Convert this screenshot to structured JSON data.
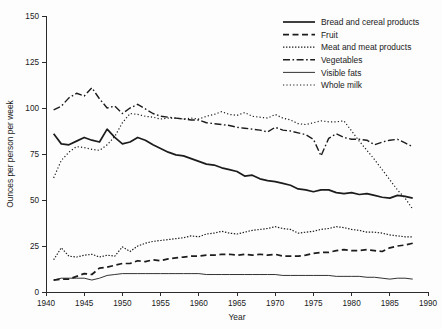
{
  "chart_data": {
    "type": "line",
    "title": "",
    "xlabel": "Year",
    "ylabel": "Ounces per person per week",
    "xlim": [
      1940,
      1990
    ],
    "ylim": [
      0,
      150
    ],
    "xticks": [
      1940,
      1945,
      1950,
      1955,
      1960,
      1965,
      1970,
      1975,
      1980,
      1985,
      1990
    ],
    "yticks": [
      0,
      25,
      50,
      75,
      100,
      125,
      150
    ],
    "grid": false,
    "legend_position": "top-right",
    "x": [
      1941,
      1942,
      1943,
      1944,
      1945,
      1946,
      1947,
      1948,
      1949,
      1950,
      1951,
      1952,
      1953,
      1954,
      1955,
      1956,
      1957,
      1958,
      1959,
      1960,
      1961,
      1962,
      1963,
      1964,
      1965,
      1966,
      1967,
      1968,
      1969,
      1970,
      1971,
      1972,
      1973,
      1974,
      1975,
      1976,
      1977,
      1978,
      1979,
      1980,
      1981,
      1982,
      1983,
      1984,
      1985,
      1986,
      1987,
      1988
    ],
    "series": [
      {
        "name": "Bread and cereal products",
        "style": "solid-thick",
        "values": [
          86.0,
          80.5,
          80.0,
          82.0,
          84.0,
          82.5,
          81.5,
          88.5,
          84.0,
          80.5,
          81.5,
          84.0,
          82.5,
          80.0,
          78.0,
          76.0,
          74.5,
          74.0,
          72.5,
          71.0,
          69.5,
          69.0,
          67.5,
          66.5,
          65.5,
          63.0,
          63.5,
          61.5,
          60.5,
          60.0,
          59.0,
          58.0,
          56.0,
          55.5,
          54.5,
          55.5,
          55.5,
          54.0,
          53.5,
          54.0,
          53.0,
          53.5,
          52.5,
          51.5,
          51.0,
          52.5,
          52.0,
          51.0
        ]
      },
      {
        "name": "Fruit",
        "style": "dashed",
        "values": [
          6.5,
          7.0,
          7.0,
          8.5,
          10.0,
          9.5,
          13.0,
          13.5,
          14.5,
          15.5,
          15.5,
          17.0,
          16.5,
          17.5,
          17.0,
          18.0,
          18.5,
          19.0,
          19.5,
          19.5,
          20.0,
          20.0,
          20.5,
          20.5,
          20.0,
          20.5,
          20.0,
          20.5,
          20.0,
          20.5,
          19.5,
          19.5,
          19.5,
          20.0,
          21.0,
          21.5,
          21.5,
          22.5,
          23.0,
          22.5,
          22.5,
          23.0,
          22.5,
          22.0,
          24.0,
          25.0,
          25.5,
          26.5
        ]
      },
      {
        "name": "Meat and meat products",
        "style": "dotted-dense",
        "values": [
          17.5,
          24.0,
          19.5,
          19.0,
          20.0,
          20.5,
          19.0,
          20.0,
          19.5,
          24.5,
          22.0,
          25.0,
          26.5,
          27.5,
          28.0,
          28.5,
          29.0,
          29.5,
          30.5,
          30.0,
          31.5,
          32.0,
          33.0,
          32.0,
          31.5,
          32.5,
          33.5,
          34.0,
          34.5,
          35.5,
          34.5,
          34.0,
          32.0,
          32.5,
          33.0,
          34.0,
          34.5,
          35.5,
          35.0,
          34.0,
          33.5,
          32.5,
          32.5,
          32.0,
          31.0,
          30.5,
          30.0,
          30.0
        ]
      },
      {
        "name": "Vegetables",
        "style": "dash-dot",
        "values": [
          99.0,
          101.0,
          105.5,
          108.0,
          106.5,
          111.0,
          105.0,
          100.0,
          101.0,
          97.0,
          100.0,
          102.0,
          99.5,
          97.0,
          95.5,
          95.0,
          94.5,
          94.0,
          93.5,
          93.5,
          92.0,
          91.5,
          91.0,
          90.5,
          89.5,
          89.0,
          88.5,
          88.0,
          87.0,
          89.5,
          88.0,
          87.5,
          86.5,
          85.5,
          83.0,
          74.0,
          83.5,
          86.0,
          84.0,
          83.0,
          83.0,
          82.5,
          80.0,
          81.5,
          82.5,
          83.0,
          81.0,
          79.0
        ]
      },
      {
        "name": "Visible fats",
        "style": "solid-thin",
        "values": [
          6.5,
          7.5,
          7.5,
          7.5,
          7.5,
          6.5,
          7.5,
          9.0,
          9.5,
          10.0,
          10.0,
          10.0,
          10.0,
          10.0,
          10.0,
          10.0,
          10.0,
          10.0,
          10.0,
          10.0,
          9.5,
          9.5,
          9.5,
          9.5,
          9.5,
          9.5,
          9.5,
          9.5,
          9.5,
          9.5,
          9.0,
          9.0,
          9.0,
          9.0,
          9.0,
          9.0,
          9.0,
          8.5,
          8.5,
          8.5,
          8.5,
          8.0,
          8.0,
          7.5,
          7.0,
          7.5,
          7.5,
          7.0
        ]
      },
      {
        "name": "Whole milk",
        "style": "dotted-sparse",
        "values": [
          62.0,
          71.5,
          76.0,
          79.0,
          78.5,
          77.5,
          77.0,
          80.0,
          84.5,
          92.0,
          97.0,
          96.5,
          95.5,
          95.0,
          94.0,
          94.5,
          94.5,
          94.0,
          94.5,
          94.0,
          95.5,
          96.5,
          98.0,
          96.5,
          96.0,
          97.5,
          95.5,
          95.0,
          94.5,
          96.5,
          94.5,
          93.5,
          91.5,
          91.0,
          92.0,
          93.0,
          92.5,
          92.5,
          93.0,
          87.5,
          82.0,
          77.0,
          72.0,
          66.5,
          61.0,
          55.5,
          51.0,
          45.0
        ]
      }
    ]
  },
  "legend": {
    "items": [
      {
        "label": "Bread and cereal products"
      },
      {
        "label": "Fruit"
      },
      {
        "label": "Meat and meat products"
      },
      {
        "label": "Vegetables"
      },
      {
        "label": "Visible fats"
      },
      {
        "label": "Whole milk"
      }
    ]
  },
  "colors": {
    "line": "#1c1c1c",
    "axis": "#2b2b2b",
    "background": "#fdfdfd",
    "text": "#1a1a1a"
  }
}
